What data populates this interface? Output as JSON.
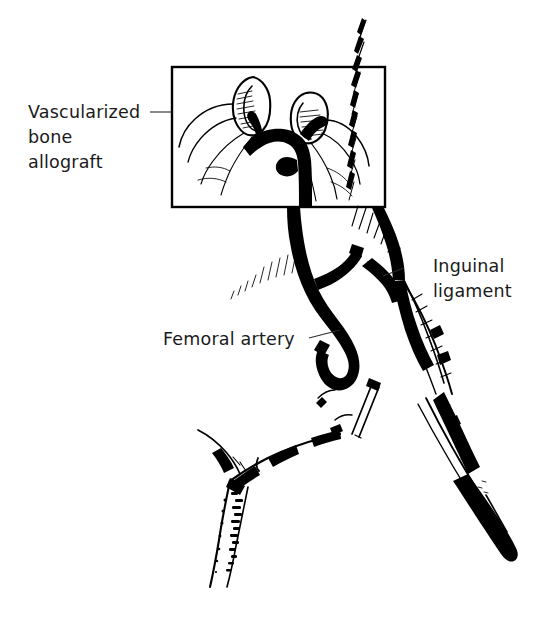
{
  "figure": {
    "kind": "medical-line-illustration",
    "background_color": "#ffffff",
    "ink_color": "#000000",
    "width": 552,
    "height": 635
  },
  "labels": {
    "allograft": {
      "line1": "Vascularized",
      "line2": "bone",
      "line3": "allograft"
    },
    "inguinal": {
      "line1": "Inguinal",
      "line2": "ligament"
    },
    "femoral": {
      "line1": "Femoral artery"
    }
  },
  "inset": {
    "name": "magnified-detail-box",
    "border_color": "#000000"
  },
  "parts": {
    "bone_graft_left": "bone-segment-left",
    "bone_graft_right": "bone-segment-right",
    "vascular_pedicle": "vascular-pedicle",
    "femoral_vessel": "femoral-vessel-loop",
    "inguinal_ligament": "inguinal-ligament",
    "thigh": "thigh-contour",
    "opposite_limb": "opposite-limb",
    "lower_leg": "lower-leg",
    "foot": "foot",
    "fixation_pin": "fixation-pin",
    "midline": "body-midline-hatching"
  }
}
